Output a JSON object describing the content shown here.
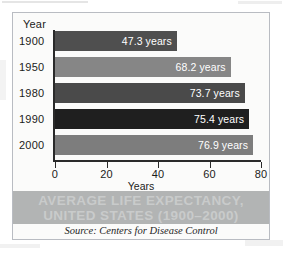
{
  "chart_data": {
    "type": "bar",
    "orientation": "horizontal",
    "title": "AVERAGE LIFE EXPECTANCY, UNITED STATES (1900–2000)",
    "title_lines": [
      "AVERAGE LIFE EXPECTANCY,",
      "UNITED STATES (1900–2000)"
    ],
    "source": "Source: Centers for Disease Control",
    "ylabel": "Year",
    "xlabel": "Years",
    "xlim": [
      0,
      80
    ],
    "xticks": [
      0,
      20,
      40,
      60,
      80
    ],
    "xtick_labels": [
      "0",
      "20",
      "40",
      "60",
      "80"
    ],
    "grid": false,
    "legend": null,
    "categories": [
      "1900",
      "1950",
      "1980",
      "1990",
      "2000"
    ],
    "values": [
      47.3,
      68.2,
      73.7,
      75.4,
      76.9
    ],
    "bars": [
      {
        "category": "1900",
        "value": 47.3,
        "label": "47.3 years",
        "color": "#4f4f4f"
      },
      {
        "category": "1950",
        "value": 68.2,
        "label": "68.2 years",
        "color": "#868686"
      },
      {
        "category": "1980",
        "value": 73.7,
        "label": "73.7 years",
        "color": "#4a4a4a"
      },
      {
        "category": "1990",
        "value": 75.4,
        "label": "75.4 years",
        "color": "#1f1f1f"
      },
      {
        "category": "2000",
        "value": 76.9,
        "label": "76.9 years",
        "color": "#7d7d7d"
      }
    ],
    "colors": {
      "axis": "#2a2a2a",
      "frame": "#b9bcc2",
      "background": "#fbfbfa",
      "banner": "#b2b4b4",
      "banner_text": "#c9cbcb",
      "value_text": "#ffffff"
    }
  }
}
